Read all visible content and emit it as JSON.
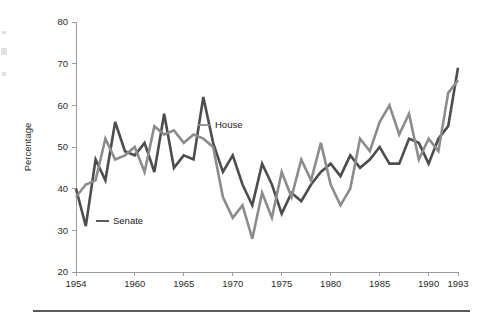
{
  "chart_data": {
    "type": "line",
    "title": "",
    "xlabel": "",
    "ylabel": "Percentage",
    "xlim": [
      1954,
      1993
    ],
    "ylim": [
      20,
      80
    ],
    "grid": false,
    "legend_position": "inline-annotations",
    "y_ticks": [
      20,
      30,
      40,
      50,
      60,
      70,
      80
    ],
    "y_tick_labels": [
      "20",
      "30",
      "40",
      "50",
      "60",
      "70",
      "80"
    ],
    "x_ticks": [
      1954,
      1960,
      1965,
      1970,
      1975,
      1980,
      1985,
      1990,
      1993
    ],
    "x_tick_labels": [
      "1954",
      "1960",
      "1965",
      "1970",
      "1975",
      "1980",
      "1985",
      "1990",
      "1993"
    ],
    "x": [
      1954,
      1955,
      1956,
      1957,
      1958,
      1959,
      1960,
      1961,
      1962,
      1963,
      1964,
      1965,
      1966,
      1967,
      1968,
      1969,
      1970,
      1971,
      1972,
      1973,
      1974,
      1975,
      1976,
      1977,
      1978,
      1979,
      1980,
      1981,
      1982,
      1983,
      1984,
      1985,
      1986,
      1987,
      1988,
      1989,
      1990,
      1991,
      1992,
      1993
    ],
    "series": [
      {
        "name": "Senate",
        "color": "#4d4d4d",
        "label": "Senate",
        "values": [
          40,
          31,
          47,
          42,
          56,
          49,
          48,
          51,
          44,
          58,
          45,
          48,
          47,
          62,
          51,
          44,
          48,
          41,
          36,
          46,
          41,
          34,
          39,
          37,
          41,
          44,
          46,
          43,
          48,
          45,
          47,
          50,
          46,
          46,
          52,
          51,
          46,
          52,
          55,
          69
        ]
      },
      {
        "name": "House",
        "color": "#8c8c8c",
        "label": "House",
        "values": [
          38,
          41,
          42,
          52,
          47,
          48,
          50,
          44,
          55,
          53,
          54,
          51,
          53,
          52,
          50,
          38,
          33,
          36,
          28,
          39,
          33,
          44,
          38,
          47,
          42,
          51,
          41,
          36,
          40,
          52,
          49,
          56,
          60,
          53,
          58,
          47,
          52,
          49,
          63,
          66
        ]
      }
    ],
    "annotations": [
      {
        "text": "Senate",
        "series": "Senate",
        "x_px": 96,
        "y_px": 224
      },
      {
        "text": "House",
        "series": "House",
        "x_px": 198,
        "y_px": 128
      }
    ],
    "axis_color": "#9b9b9b",
    "text_color": "#2b2b2b",
    "background": "#ffffff"
  }
}
